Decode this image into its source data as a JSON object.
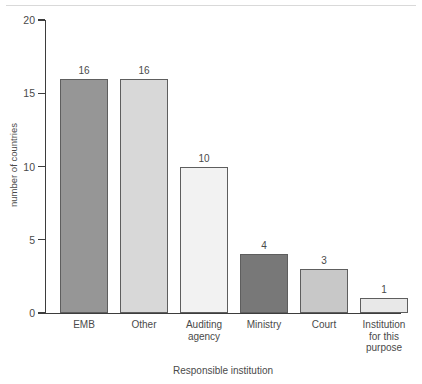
{
  "chart_data": {
    "type": "bar",
    "title": "",
    "xlabel": "Responsible institution",
    "ylabel": "number of countries",
    "categories": [
      "EMB",
      "Other",
      "Auditing agency",
      "Ministry",
      "Court",
      "Institution for this purpose"
    ],
    "category_lines": [
      [
        "EMB"
      ],
      [
        "Other"
      ],
      [
        "Auditing",
        "agency"
      ],
      [
        "Ministry"
      ],
      [
        "Court"
      ],
      [
        "Institution",
        "for this",
        "purpose"
      ]
    ],
    "values": [
      16,
      16,
      10,
      4,
      3,
      1
    ],
    "value_labels": [
      "16",
      "16",
      "10",
      "4",
      "3",
      "1"
    ],
    "bar_colors": [
      "#969696",
      "#d8d8d8",
      "#f2f2f2",
      "#787878",
      "#c8c8c8",
      "#e8e8e8"
    ],
    "bar_outline_color": "#5e5e5e",
    "ylim": [
      0,
      20
    ],
    "yticks": [
      0,
      5,
      10,
      15,
      20
    ],
    "ytick_labels": [
      "0",
      "5",
      "10",
      "15",
      "20"
    ],
    "grid": false,
    "legend": null,
    "axis_color": "#3d3d3d",
    "text_color": "#4a4a4a",
    "background": "#ffffff"
  }
}
